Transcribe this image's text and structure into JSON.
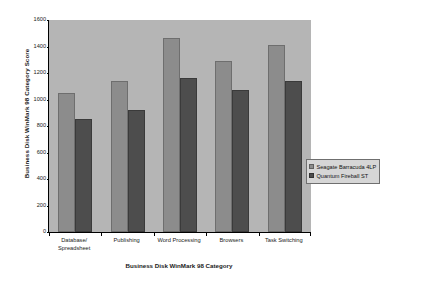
{
  "chart_data": {
    "type": "bar",
    "title": "",
    "xlabel": "Business Disk WinMark 98 Category",
    "ylabel": "Business Disk WinMark 98 Category Score",
    "ylim": [
      0,
      1600
    ],
    "yticks": [
      0,
      200,
      400,
      600,
      800,
      1000,
      1200,
      1400,
      1600
    ],
    "ytick_labels": [
      "0",
      "200",
      "400",
      "600",
      "800",
      "1000",
      "1200",
      "1400",
      "1600"
    ],
    "grid": false,
    "legend_position": "right-center",
    "categories": [
      "Database/ Spreadsheet",
      "Publishing",
      "Word Processing",
      "Browsers",
      "Task Switching"
    ],
    "category_lines": [
      [
        "Database/",
        "Spreadsheet"
      ],
      [
        "Publishing"
      ],
      [
        "Word Processing"
      ],
      [
        "Browsers"
      ],
      [
        "Task Switching"
      ]
    ],
    "series": [
      {
        "name": "Seagate Barracuda 4LP",
        "color": "#8c8c8c",
        "values": [
          1050,
          1140,
          1465,
          1290,
          1410
        ]
      },
      {
        "name": "Quantum Fireball ST",
        "color": "#4d4d4d",
        "values": [
          855,
          920,
          1165,
          1070,
          1140
        ]
      }
    ],
    "colors": {
      "plot_background": "#b5b5b5",
      "page_background": "#ffffff",
      "axis": "#000000",
      "text": "#1a1a1a",
      "legend_background": "#d6d6d6"
    }
  }
}
